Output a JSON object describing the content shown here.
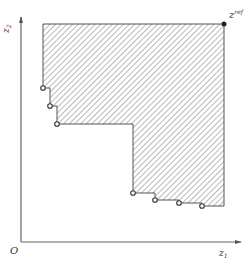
{
  "figure": {
    "type": "hypervolume-dominated-region",
    "axes": {
      "x_label": "z",
      "x_label_sub": "1",
      "y_label": "z",
      "y_label_sub": "2",
      "origin_label": "O"
    },
    "reference_point": {
      "label": "z",
      "label_sup": "ref",
      "x": 224,
      "y": 24
    },
    "pareto_points": [
      {
        "x": 43,
        "y": 88
      },
      {
        "x": 50,
        "y": 106
      },
      {
        "x": 57,
        "y": 124
      },
      {
        "x": 133,
        "y": 193
      },
      {
        "x": 155,
        "y": 200
      },
      {
        "x": 179,
        "y": 203
      },
      {
        "x": 202,
        "y": 206
      }
    ],
    "colors": {
      "axis": "#666666",
      "region_edge": "#555555",
      "hatch": "#888888",
      "point_fill": "#ffffff",
      "point_stroke": "#333333",
      "ref_point": "#222222"
    }
  }
}
